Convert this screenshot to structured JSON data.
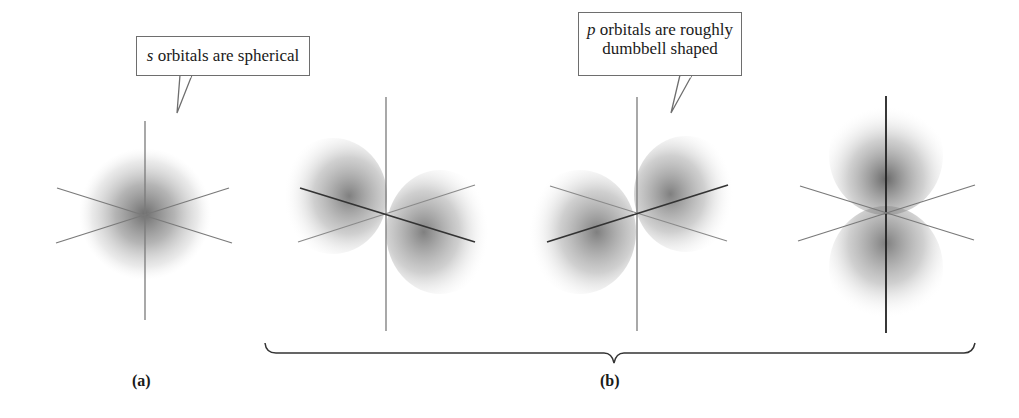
{
  "callouts": {
    "s": {
      "prefix": "s",
      "text": " orbitals are spherical"
    },
    "p": {
      "prefix": "p",
      "line1": " orbitals are roughly",
      "line2": "dumbbell shaped"
    }
  },
  "panels": {
    "a": {
      "label": "(a)",
      "orbital": "s",
      "shape": "sphere"
    },
    "b": {
      "label": "(b)",
      "orbitals": [
        {
          "name": "p-orbital-1",
          "orientation": "lobes along front-back axis (left-right)"
        },
        {
          "name": "p-orbital-2",
          "orientation": "lobes along diagonal axis (left-right)"
        },
        {
          "name": "p-orbital-3",
          "orientation": "lobes along vertical axis"
        }
      ]
    }
  },
  "colors": {
    "axis": "#7a7a7a",
    "axis_dark": "#333333",
    "cloud": "#6a6a6a",
    "border": "#6e6e6e"
  }
}
